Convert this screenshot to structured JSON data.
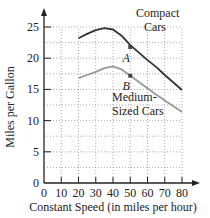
{
  "chart_data": {
    "type": "line",
    "title": "",
    "xlabel": "Constant Speed (in miles per hour)",
    "ylabel": "Miles per Gallon",
    "xlim": [
      0,
      80
    ],
    "ylim": [
      0,
      25
    ],
    "xticks": [
      0,
      10,
      20,
      30,
      40,
      50,
      60,
      70,
      80
    ],
    "yticks": [
      0,
      5,
      10,
      15,
      20,
      25
    ],
    "grid": true,
    "grid_style": "dotted",
    "series": [
      {
        "name": "Compact Cars",
        "label_lines": [
          "Compact",
          "Cars"
        ],
        "color": "#333333",
        "x": [
          20,
          25,
          30,
          35,
          40,
          45,
          50,
          55,
          60,
          65,
          70,
          75,
          80
        ],
        "y": [
          23.2,
          23.9,
          24.5,
          24.8,
          24.6,
          23.6,
          22.1,
          20.9,
          19.7,
          18.6,
          17.3,
          16.1,
          14.9
        ]
      },
      {
        "name": "Medium-Sized Cars",
        "label_lines": [
          "Medium-",
          "Sized Cars"
        ],
        "color": "#999999",
        "x": [
          20,
          25,
          30,
          35,
          40,
          45,
          50,
          55,
          60,
          65,
          70,
          75,
          80
        ],
        "y": [
          16.8,
          17.3,
          17.8,
          18.4,
          18.7,
          18.2,
          17.2,
          16.2,
          15.2,
          14.2,
          13.2,
          12.3,
          11.4
        ]
      }
    ],
    "annotations": [
      {
        "text": "A",
        "x": 49,
        "y": 20.1,
        "marker": {
          "x": 50,
          "y": 21.8
        }
      },
      {
        "text": "B",
        "x": 49,
        "y": 15.6,
        "marker": {
          "x": 50,
          "y": 17.2
        }
      }
    ]
  }
}
